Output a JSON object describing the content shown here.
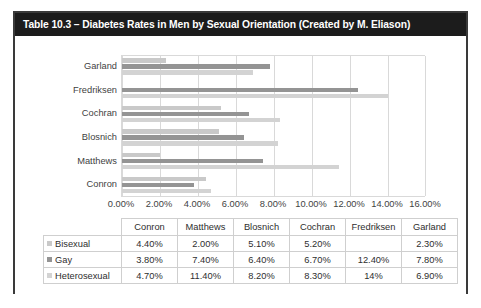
{
  "title": "Table 10.3 – Diabetes Rates in Men by Sexual Orientation (Created by M. Eliason)",
  "colors": {
    "bisexual": "#c9c9c9",
    "gay": "#949494",
    "heterosexual": "#d3d3d3",
    "title_bar": "#1c1c1c",
    "frame": "#3a3a3a",
    "gridline": "#d9d9d9"
  },
  "table": {
    "corner_label": "",
    "column_headers": [
      "Conron",
      "Matthews",
      "Blosnich",
      "Cochran",
      "Fredriksen",
      "Garland"
    ],
    "rows": [
      {
        "label": "Bisexual",
        "swatch": "legend-swatch-bisexual",
        "values": [
          "4.40%",
          "2.00%",
          "5.10%",
          "5.20%",
          "",
          "2.30%"
        ]
      },
      {
        "label": "Gay",
        "swatch": "legend-swatch-gay",
        "values": [
          "3.80%",
          "7.40%",
          "6.40%",
          "6.70%",
          "12.40%",
          "7.80%"
        ]
      },
      {
        "label": "Heterosexual",
        "swatch": "legend-swatch-heterosexual",
        "values": [
          "4.70%",
          "11.40%",
          "8.20%",
          "8.30%",
          "14%",
          "6.90%"
        ]
      }
    ]
  },
  "chart_data": {
    "type": "bar",
    "orientation": "horizontal",
    "title": "Table 10.3 – Diabetes Rates in Men by Sexual Orientation (Created by M. Eliason)",
    "xlabel": "",
    "ylabel": "",
    "categories": [
      "Conron",
      "Matthews",
      "Blosnich",
      "Cochran",
      "Fredriksen",
      "Garland"
    ],
    "category_order_top_to_bottom": [
      "Garland",
      "Fredriksen",
      "Cochran",
      "Blosnich",
      "Matthews",
      "Conron"
    ],
    "series": [
      {
        "name": "Bisexual",
        "color": "#c9c9c9",
        "values": [
          4.4,
          2.0,
          5.1,
          5.2,
          null,
          2.3
        ]
      },
      {
        "name": "Gay",
        "color": "#949494",
        "values": [
          3.8,
          7.4,
          6.4,
          6.7,
          12.4,
          7.8
        ]
      },
      {
        "name": "Heterosexual",
        "color": "#d3d3d3",
        "values": [
          4.7,
          11.4,
          8.2,
          8.3,
          14.0,
          6.9
        ]
      }
    ],
    "xlim": [
      0,
      16
    ],
    "xticks": [
      0,
      2,
      4,
      6,
      8,
      10,
      12,
      14,
      16
    ],
    "xtick_labels": [
      "0.00%",
      "2.00%",
      "4.00%",
      "6.00%",
      "8.00%",
      "10.00%",
      "12.00%",
      "14.00%",
      "16.00%"
    ],
    "grid": true,
    "legend_position": "table-row-headers",
    "units": "percent"
  }
}
